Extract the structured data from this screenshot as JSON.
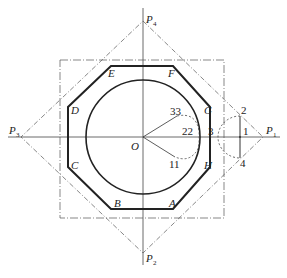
{
  "diagram": {
    "title": "",
    "center_label": "O",
    "poles": [
      {
        "id": "P1",
        "letter": "P",
        "sub": "1"
      },
      {
        "id": "P2",
        "letter": "P",
        "sub": "2"
      },
      {
        "id": "P3",
        "letter": "P",
        "sub": "3"
      },
      {
        "id": "P4",
        "letter": "P",
        "sub": "4"
      }
    ],
    "octagon_vertices": [
      "A",
      "B",
      "C",
      "D",
      "E",
      "F",
      "G",
      "H"
    ],
    "point_labels": {
      "n1": "1",
      "n2": "2",
      "n3": "3",
      "n4": "4",
      "n11": "11",
      "n22": "22",
      "n33": "33"
    },
    "colors": {
      "line": "#222222",
      "thin_line": "#555555",
      "background": "#ffffff"
    }
  }
}
